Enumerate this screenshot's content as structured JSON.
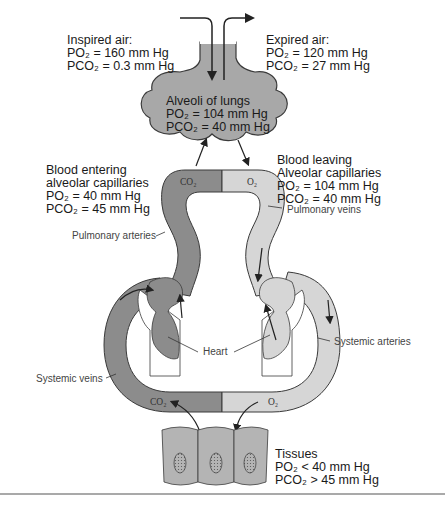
{
  "figure": {
    "colors": {
      "deoxygenated_blood": "#8c8c8c",
      "oxygenated_blood": "#d6d6d6",
      "alveoli_fill": "#a8a8a8",
      "tissue_fill": "#b4b4b4",
      "outline": "#3a3a3a",
      "text": "#1a1a1a",
      "rule": "#555555"
    }
  },
  "labels": {
    "inspired_air": {
      "title": "Inspired air:",
      "po2": "PO₂ = 160 mm Hg",
      "pco2": "PCO₂ = 0.3 mm Hg"
    },
    "expired_air": {
      "title": "Expired air:",
      "po2": "PO₂ = 120 mm Hg",
      "pco2": "PCO₂ = 27 mm Hg"
    },
    "alveoli": {
      "title": "Alveoli of lungs",
      "po2": "PO₂ = 104 mm Hg",
      "pco2": "PCO₂ = 40 mm Hg"
    },
    "blood_entering": {
      "title1": "Blood entering",
      "title2": "alveolar capillaries",
      "po2": "PO₂ = 40 mm Hg",
      "pco2": "PCO₂ = 45 mm Hg"
    },
    "blood_leaving": {
      "title1": "Blood leaving",
      "title2": "Alveolar capillaries",
      "po2": "PO₂ = 104 mm Hg",
      "pco2": "PCO₂ = 40 mm Hg"
    },
    "tissues": {
      "title": "Tissues",
      "po2": "PO₂ < 40 mm Hg",
      "pco2": "PCO₂ > 45 mm Hg"
    }
  },
  "callouts": {
    "pulmonary_arteries": "Pulmonary arteries",
    "pulmonary_veins": "Pulmonary veins",
    "heart": "Heart",
    "systemic_arteries": "Systemic arteries",
    "systemic_veins": "Systemic veins"
  },
  "gas_tags": {
    "lung_co2": "CO₂",
    "lung_o2": "O₂",
    "tissue_co2": "CO₂",
    "tissue_o2": "O₂"
  }
}
